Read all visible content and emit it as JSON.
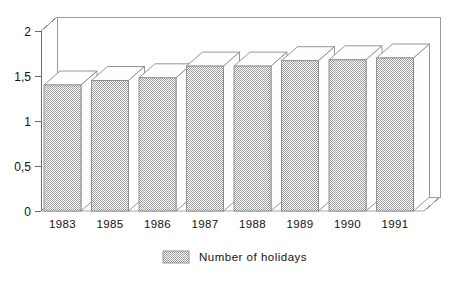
{
  "chart_data": {
    "type": "bar",
    "title": "",
    "subtitle": "",
    "xlabel": "",
    "ylabel": "",
    "categories": [
      "1983",
      "1985",
      "1986",
      "1987",
      "1988",
      "1989",
      "1990",
      "1991"
    ],
    "series": [
      {
        "name": "Number of holidays",
        "values": [
          1.4,
          1.45,
          1.48,
          1.61,
          1.61,
          1.67,
          1.68,
          1.7
        ]
      }
    ],
    "ylim": [
      0,
      2
    ],
    "ytick_values": [
      0,
      0.5,
      1,
      1.5,
      2
    ],
    "ytick_labels": [
      "0",
      "0,5",
      "1",
      "1,5",
      "2"
    ],
    "grid": false,
    "legend_position": "bottom-center",
    "style": "3d-bar",
    "decimal_separator": ",",
    "colors": {
      "bar_fill": "#b9b9b9",
      "bar_outline": "#8a8a8a",
      "bar_top_face": "#fefefe",
      "frame": "#9a9a9a",
      "axis": "#6e6e6e",
      "text": "#121212",
      "background": "#ffffff"
    }
  },
  "legend": {
    "items": [
      {
        "label": "Number of holidays",
        "swatch_name": "legend-swatch-number-of-holidays"
      }
    ]
  },
  "axes": {
    "y": {
      "labels": [
        "2",
        "1,5",
        "1",
        "0,5",
        "0"
      ]
    },
    "x": {
      "labels": [
        "1983",
        "1985",
        "1986",
        "1987",
        "1988",
        "1989",
        "1990",
        "1991"
      ]
    }
  }
}
